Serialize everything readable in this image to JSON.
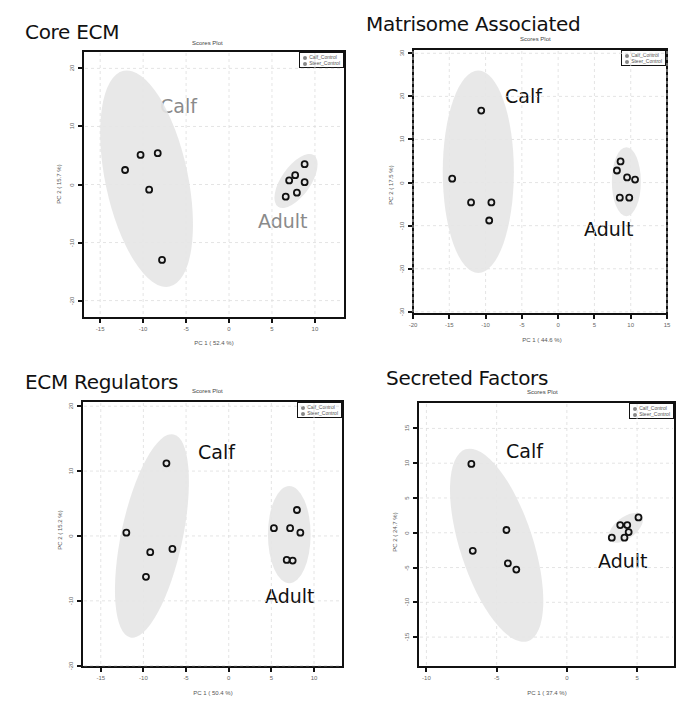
{
  "caption_partial": "",
  "chart_data": [
    {
      "type": "scatter",
      "panel_title": "Core ECM",
      "title": "Scores Plot",
      "xlabel": "PC 1 ( 52.4 %)",
      "ylabel": "PC 2 ( 15.7 %)",
      "xlim": [
        -17,
        13.5
      ],
      "ylim": [
        -23,
        23
      ],
      "xticks": [
        -15,
        -10,
        -5,
        0,
        5,
        10
      ],
      "yticks": [
        20,
        10,
        0,
        -10,
        -20
      ],
      "grid": true,
      "legend": [
        "Calf_Control",
        "Steer_Control"
      ],
      "legend_position": "top-right",
      "annotations": [
        {
          "text": "Calf",
          "color": "#8a8a8a"
        },
        {
          "text": "Adult",
          "color": "#8a8a8a"
        }
      ],
      "series": [
        {
          "name": "Calf_Control",
          "label": "Calf",
          "points": [
            [
              -12.1,
              2.5
            ],
            [
              -10.3,
              5.1
            ],
            [
              -8.3,
              5.4
            ],
            [
              -9.3,
              -0.9
            ],
            [
              -7.8,
              -13.0
            ]
          ],
          "ellipse": {
            "cx": -9.6,
            "cy": 1.0,
            "rx": 4.8,
            "ry": 19.0,
            "rotate": -12
          }
        },
        {
          "name": "Steer_Control",
          "label": "Adult",
          "points": [
            [
              8.8,
              3.5
            ],
            [
              7.7,
              1.6
            ],
            [
              7.0,
              0.7
            ],
            [
              8.8,
              0.4
            ],
            [
              7.9,
              -1.4
            ],
            [
              6.6,
              -2.1
            ]
          ],
          "ellipse": {
            "cx": 7.8,
            "cy": 0.6,
            "rx": 1.7,
            "ry": 5.4,
            "rotate": 35
          }
        }
      ]
    },
    {
      "type": "scatter",
      "panel_title": "Matrisome Associated",
      "title": "Scores Plot",
      "xlabel": "PC 1 ( 44.6 %)",
      "ylabel": "PC 2 ( 17.5 %)",
      "xlim": [
        -20,
        15
      ],
      "ylim": [
        -30.5,
        31
      ],
      "xticks": [
        -20,
        -15,
        -10,
        -5,
        0,
        5,
        10,
        15
      ],
      "yticks": [
        30,
        20,
        10,
        0,
        -10,
        -20,
        -30
      ],
      "grid": true,
      "legend": [
        "Calf_Control",
        "Steer_Control"
      ],
      "legend_position": "top-right",
      "annotations": [
        {
          "text": "Calf",
          "color": "#111111"
        },
        {
          "text": "Adult",
          "color": "#111111"
        }
      ],
      "series": [
        {
          "name": "Calf_Control",
          "label": "Calf",
          "points": [
            [
              -10.6,
              16.7
            ],
            [
              -14.6,
              0.9
            ],
            [
              -12.0,
              -4.6
            ],
            [
              -9.2,
              -4.6
            ],
            [
              -9.5,
              -8.8
            ]
          ],
          "ellipse": {
            "cx": -11.0,
            "cy": 2.5,
            "rx": 4.9,
            "ry": 23.5,
            "rotate": 0
          }
        },
        {
          "name": "Steer_Control",
          "label": "Adult",
          "points": [
            [
              8.6,
              4.9
            ],
            [
              8.1,
              2.8
            ],
            [
              9.5,
              1.2
            ],
            [
              10.6,
              0.7
            ],
            [
              8.5,
              -3.5
            ],
            [
              9.8,
              -3.5
            ]
          ],
          "ellipse": {
            "cx": 9.4,
            "cy": 0.2,
            "rx": 2.0,
            "ry": 8.0,
            "rotate": 0
          }
        }
      ]
    },
    {
      "type": "scatter",
      "panel_title": "ECM Regulators",
      "title": "Scores Plot",
      "xlabel": "PC 1 ( 50.4 %)",
      "ylabel": "PC 2 ( 15.2 %)",
      "xlim": [
        -17.2,
        13.4
      ],
      "ylim": [
        -20.2,
        20.8
      ],
      "xticks": [
        -15,
        -10,
        -5,
        0,
        5,
        10
      ],
      "yticks": [
        20,
        10,
        0,
        -10,
        -20
      ],
      "grid": true,
      "legend": [
        "Calf_Control",
        "Steer_Control"
      ],
      "legend_position": "top-right",
      "annotations": [
        {
          "text": "Calf",
          "color": "#111111"
        },
        {
          "text": "Adult",
          "color": "#111111"
        }
      ],
      "series": [
        {
          "name": "Calf_Control",
          "label": "Calf",
          "points": [
            [
              -7.3,
              11.2
            ],
            [
              -12.0,
              0.5
            ],
            [
              -9.2,
              -2.5
            ],
            [
              -6.6,
              -2.0
            ],
            [
              -9.7,
              -6.3
            ]
          ],
          "ellipse": {
            "cx": -9.0,
            "cy": 0.0,
            "rx": 3.6,
            "ry": 16.0,
            "rotate": 12
          }
        },
        {
          "name": "Steer_Control",
          "label": "Adult",
          "points": [
            [
              8.0,
              4.0
            ],
            [
              5.3,
              1.2
            ],
            [
              7.2,
              1.2
            ],
            [
              8.4,
              0.5
            ],
            [
              6.8,
              -3.7
            ],
            [
              7.5,
              -3.8
            ]
          ],
          "ellipse": {
            "cx": 7.1,
            "cy": 0.2,
            "rx": 2.5,
            "ry": 7.5,
            "rotate": 0
          }
        }
      ]
    },
    {
      "type": "scatter",
      "panel_title": "Secreted Factors",
      "title": "Scores Plot",
      "xlabel": "PC 1 ( 37.4 %)",
      "ylabel": "PC 2 ( 24.7 %)",
      "xlim": [
        -10.6,
        7.7
      ],
      "ylim": [
        -19.3,
        18.8
      ],
      "xticks": [
        -10,
        -5,
        0,
        5
      ],
      "yticks": [
        15,
        10,
        5,
        0,
        -5,
        -10,
        -15
      ],
      "grid": true,
      "legend": [
        "Calf_Control",
        "Steer_Control"
      ],
      "legend_position": "top-right",
      "annotations": [
        {
          "text": "Calf",
          "color": "#111111"
        },
        {
          "text": "Adult",
          "color": "#111111"
        }
      ],
      "series": [
        {
          "name": "Calf_Control",
          "label": "Calf",
          "points": [
            [
              -6.8,
              9.9
            ],
            [
              -4.3,
              0.4
            ],
            [
              -6.7,
              -2.6
            ],
            [
              -4.2,
              -4.4
            ],
            [
              -3.6,
              -5.3
            ]
          ],
          "ellipse": {
            "cx": -5.0,
            "cy": -1.8,
            "rx": 2.6,
            "ry": 14.5,
            "rotate": -18
          }
        },
        {
          "name": "Steer_Control",
          "label": "Adult",
          "points": [
            [
              5.1,
              2.2
            ],
            [
              3.8,
              1.1
            ],
            [
              4.3,
              1.1
            ],
            [
              4.4,
              0.1
            ],
            [
              3.2,
              -0.7
            ],
            [
              4.1,
              -0.7
            ]
          ],
          "ellipse": {
            "cx": 4.2,
            "cy": 0.7,
            "rx": 0.75,
            "ry": 2.9,
            "rotate": 52
          }
        }
      ]
    }
  ]
}
